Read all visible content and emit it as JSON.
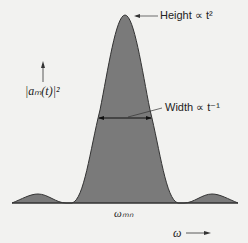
{
  "figure": {
    "peak_label": "Height ∝ t²",
    "width_label": "Width ∝ t⁻¹",
    "y_axis_label": "|aₘ(t)|²",
    "x_center_label": "ωₘₙ",
    "x_axis_label": "ω",
    "fill_color": "#7a7a7a",
    "background": "#f2f2f0"
  }
}
